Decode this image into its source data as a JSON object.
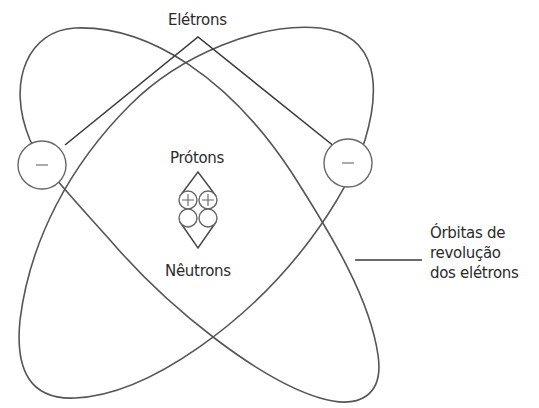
{
  "diagram": {
    "type": "atom-model",
    "labels": {
      "electrons": "Elétrons",
      "protons": "Prótons",
      "neutrons": "Nêutrons",
      "orbits_line1": "Órbitas de",
      "orbits_line2": "revolução",
      "orbits_line3": "dos elétrons"
    },
    "electrons": [
      {
        "position": "left",
        "charge": "−"
      },
      {
        "position": "right",
        "charge": "−"
      }
    ],
    "nucleus": {
      "protons": [
        {
          "charge": "+"
        },
        {
          "charge": "+"
        }
      ],
      "neutrons": [
        {},
        {}
      ]
    },
    "colors": {
      "stroke": "#555555",
      "text": "#2b2b2b",
      "background": "#ffffff"
    }
  }
}
